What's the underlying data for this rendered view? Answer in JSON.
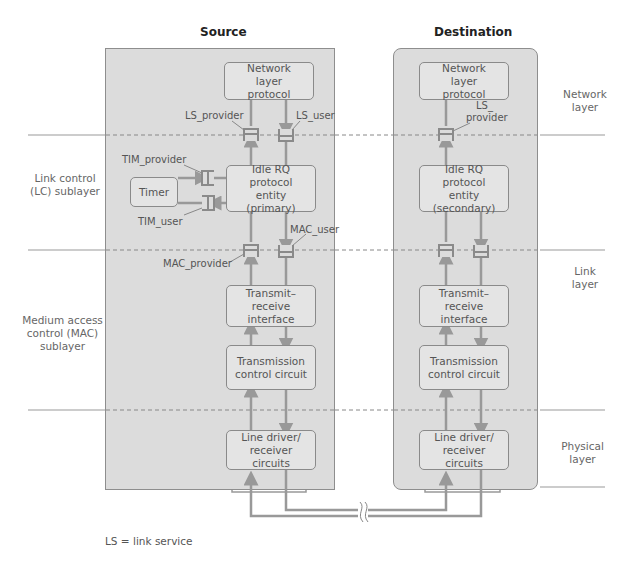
{
  "titles": {
    "source": "Source",
    "destination": "Destination"
  },
  "source": {
    "network": "Network layer protocol",
    "idle_rq": "Idle RQ protocol entity (primary)",
    "timer": "Timer",
    "trx": "Transmit–receive interface",
    "tcc": "Transmission control circuit",
    "line": "Line driver/ receiver circuits"
  },
  "destination": {
    "network": "Network layer protocol",
    "idle_rq": "Idle RQ protocol entity (secondary)",
    "trx": "Transmit–receive interface",
    "tcc": "Transmission control circuit",
    "line": "Line driver/ receiver circuits"
  },
  "sap_labels": {
    "ls_provider": "LS_provider",
    "ls_user": "LS_user",
    "tim_provider": "TIM_provider",
    "tim_user": "TIM_user",
    "mac_provider": "MAC_provider",
    "mac_user": "MAC_user",
    "dest_ls_provider_1": "LS_",
    "dest_ls_provider_2": "provider"
  },
  "left_labels": {
    "lc": "Link control (LC) sublayer",
    "mac": "Medium access control (MAC) sublayer"
  },
  "right_labels": {
    "network": "Network layer",
    "link": "Link layer",
    "physical": "Physical layer"
  },
  "footnote": "LS = link service",
  "colors": {
    "panel": "#dcdcdc",
    "box": "#e4e4e4",
    "line": "#8a8a8a",
    "arrow": "#999999"
  }
}
